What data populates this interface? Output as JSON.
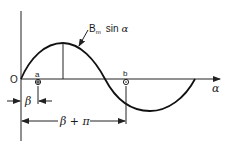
{
  "diagram": {
    "type": "sine-wave-annotation",
    "curve_label": {
      "main": "B",
      "subscript": "m",
      "rest": "sin",
      "variable": "α"
    },
    "axis_label": "α",
    "origin_label": "O",
    "points": [
      {
        "label": "a",
        "symbol": "⊕"
      },
      {
        "label": "b",
        "symbol": "⊙"
      }
    ],
    "dimensions": [
      {
        "label": "β"
      },
      {
        "label": "β + π"
      }
    ],
    "colors": {
      "line": "#222222",
      "background": "#ffffff"
    }
  }
}
